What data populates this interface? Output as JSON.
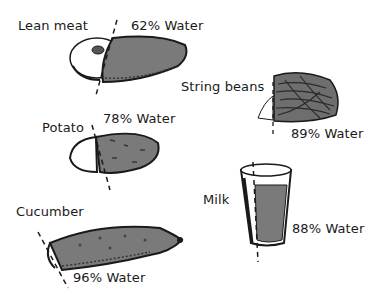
{
  "foods": [
    {
      "name": "Lean meat",
      "water_label": "62% Water",
      "water_pct": 62
    },
    {
      "name": "String beans",
      "water_label": "89% Water",
      "water_pct": 89
    },
    {
      "name": "Potato",
      "water_label": "78% Water",
      "water_pct": 78
    },
    {
      "name": "Milk",
      "water_label": "88% Water",
      "water_pct": 88
    },
    {
      "name": "Cucumber",
      "water_label": "96% Water",
      "water_pct": 96
    }
  ],
  "colors": {
    "water_fill": "#7a7a7a",
    "outline": "#1a1a1a",
    "background": "#ffffff"
  }
}
